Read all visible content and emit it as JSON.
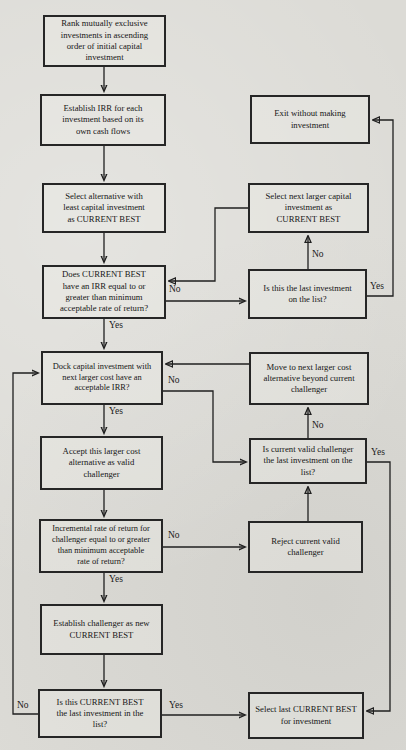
{
  "page": {
    "paper_color": "#dcdbd6",
    "ink_color": "#1f1f1f"
  },
  "flowchart": {
    "nodes": {
      "rank": "Rank mutually exclusive\ninvestments in ascending\norder of initial capital\ninvestment",
      "establish_irr": "Establish IRR for each\ninvestment based on its\nown cash flows",
      "select_least": "Select alternative with\nleast capital investment\nas CURRENT BEST",
      "does_current_best": "Does CURRENT BEST\nhave an IRR equal to or\ngreater than minimum\nacceptable rate of return?",
      "dock_capital": "Dock capital investment with\nnext larger cost have an\nacceptable IRR?",
      "accept_larger": "Accept this larger cost\nalternative as valid\nchallenger",
      "incremental": "Incremental rate of return for\nchallenger equal to or greater\nthan minimum acceptable\nrate of return?",
      "establish_challenger": "Establish challenger as new\nCURRENT BEST",
      "is_cb_last": "Is this CURRENT BEST\nthe last investment in the\nlist?",
      "exit": "Exit without making\ninvestment",
      "select_next": "Select next larger capital\ninvestment as\nCURRENT BEST",
      "is_last": "Is this the last investment\non the list?",
      "move_next": "Move to next larger cost\nalternative beyond current\nchallenger",
      "is_challenger_last": "Is current valid challenger\nthe last investment on the\nlist?",
      "reject": "Reject current valid\nchallenger",
      "select_last": "Select last CURRENT BEST\nfor investment"
    },
    "labels": {
      "yes": "Yes",
      "no": "No"
    }
  }
}
